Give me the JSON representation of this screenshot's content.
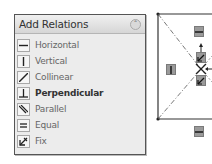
{
  "panel": {
    "title": "Add Relations",
    "collapse_icon": "double-chevron-up-icon",
    "items": [
      {
        "label": "Horizontal",
        "icon": "horizontal-icon",
        "bold": false
      },
      {
        "label": "Vertical",
        "icon": "vertical-icon",
        "bold": false
      },
      {
        "label": "Collinear",
        "icon": "collinear-icon",
        "bold": false
      },
      {
        "label": "Perpendicular",
        "icon": "perpendicular-icon",
        "bold": true
      },
      {
        "label": "Parallel",
        "icon": "parallel-icon",
        "bold": false
      },
      {
        "label": "Equal",
        "icon": "equal-icon",
        "bold": false
      },
      {
        "label": "Fix",
        "icon": "fix-icon",
        "bold": false
      }
    ]
  },
  "sketch": {
    "relation_badges": [
      "horizontal",
      "vertical",
      "fix",
      "fix",
      "horizontal"
    ]
  }
}
